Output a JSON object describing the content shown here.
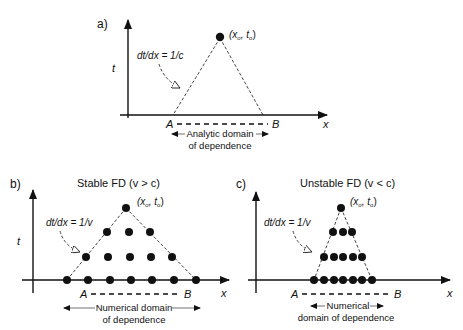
{
  "figure": {
    "panels": [
      {
        "id": "a",
        "label": "a)",
        "title": "",
        "axis_t": "t",
        "axis_x": "x",
        "point_label": "(x",
        "point_label_sub0": "o",
        "point_label_mid": ", t",
        "point_label_sub1": "o",
        "point_label_end": ")",
        "slope_label": "dt/dx = 1/c",
        "endpoint_A": "A",
        "endpoint_B": "B",
        "domain_line1": "Analytic domain",
        "domain_line2": "of dependence"
      },
      {
        "id": "b",
        "label": "b)",
        "title": "Stable FD (v > c)",
        "axis_t": "t",
        "axis_x": "x",
        "point_label": "(x",
        "point_label_sub0": "o",
        "point_label_mid": ", t",
        "point_label_sub1": "o",
        "point_label_end": ")",
        "slope_label": "dt/dx = 1/v",
        "endpoint_A": "A",
        "endpoint_B": "B",
        "domain_line1": "Numerical domain",
        "domain_line2": "of dependence",
        "grid_rows": [
          7,
          5,
          3,
          1
        ]
      },
      {
        "id": "c",
        "label": "c)",
        "title": "Unstable FD (v < c)",
        "axis_t": "t",
        "axis_x": "x",
        "point_label": "(x",
        "point_label_sub0": "o",
        "point_label_mid": ", t",
        "point_label_sub1": "o",
        "point_label_end": ")",
        "slope_label": "dt/dx = 1/v",
        "endpoint_A": "A",
        "endpoint_B": "B",
        "domain_line1": "Numerical",
        "domain_line2": "domain of dependence",
        "grid_rows": [
          7,
          5,
          3,
          1
        ]
      }
    ]
  }
}
